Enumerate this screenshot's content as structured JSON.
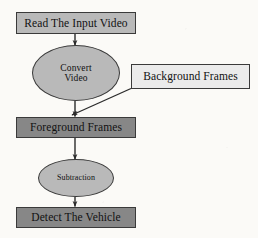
{
  "diagram": {
    "type": "flowchart",
    "orientation": "vertical",
    "background_color": "#fbfaf7",
    "palette": {
      "light_gray": "#b9b9b9",
      "dark_gray": "#878787",
      "pale_gray": "#ebebeb",
      "outline": "#3a3a3a",
      "text": "#111111"
    },
    "nodes": [
      {
        "id": "read-input",
        "label": "Read The Input Video",
        "shape": "rectangle",
        "fill": "#b9b9b9"
      },
      {
        "id": "convert",
        "label": "Convert\nVideo",
        "shape": "ellipse",
        "fill": "#b9b9b9"
      },
      {
        "id": "background",
        "label": "Background Frames",
        "shape": "rectangle",
        "fill": "#ebebeb"
      },
      {
        "id": "foreground",
        "label": "Foreground Frames",
        "shape": "rectangle",
        "fill": "#878787"
      },
      {
        "id": "subtraction",
        "label": "Subtraction",
        "shape": "ellipse",
        "fill": "#b9b9b9"
      },
      {
        "id": "detect",
        "label": "Detect The Vehicle",
        "shape": "rectangle",
        "fill": "#878787"
      }
    ],
    "edges": [
      {
        "id": "edge-read-to-convert",
        "from": "read-input",
        "to": "convert",
        "style": "straight-vertical",
        "arrow": true
      },
      {
        "id": "edge-convert-to-foreground",
        "from": "convert",
        "to": "foreground",
        "style": "straight-vertical",
        "arrow": true
      },
      {
        "id": "edge-background-to-foreground",
        "from": "background",
        "to": "foreground",
        "style": "diagonal",
        "arrow": true
      },
      {
        "id": "edge-foreground-to-subtraction",
        "from": "foreground",
        "to": "subtraction",
        "style": "straight-vertical",
        "arrow": true
      },
      {
        "id": "edge-subtraction-to-detect",
        "from": "subtraction",
        "to": "detect",
        "style": "straight-vertical",
        "arrow": true
      }
    ]
  }
}
